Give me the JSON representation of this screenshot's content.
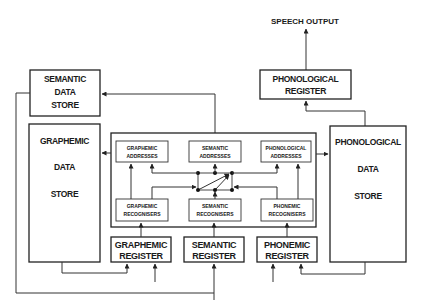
{
  "output_label": "SPEECH OUTPUT",
  "phonological_register": {
    "line1": "PHONOLOGICAL",
    "line2": "REGISTER"
  },
  "semantic_data_store": {
    "line1": "SEMANTIC",
    "line2": "DATA",
    "line3": "STORE"
  },
  "graphemic_data_store": {
    "line1": "GRAPHEMIC",
    "line2": "DATA",
    "line3": "STORE"
  },
  "phonological_data_store": {
    "line1": "PHONOLOGICAL",
    "line2": "DATA",
    "line3": "STORE"
  },
  "addresses": [
    {
      "line1": "GRAPHEMIC",
      "line2": "ADDRESSES"
    },
    {
      "line1": "SEMANTIC",
      "line2": "ADDRESSES"
    },
    {
      "line1": "PHONOLOGICAL",
      "line2": "ADDRESSES"
    }
  ],
  "recognisers": [
    {
      "line1": "GRAPHEMIC",
      "line2": "RECOGNISERS"
    },
    {
      "line1": "SEMANTIC",
      "line2": "RECOGNISERS"
    },
    {
      "line1": "PHONEMIC",
      "line2": "RECOGNISERS"
    }
  ],
  "registers": [
    {
      "line1": "GRAPHEMIC",
      "line2": "REGISTER"
    },
    {
      "line1": "SEMANTIC",
      "line2": "REGISTER"
    },
    {
      "line1": "PHONEMIC",
      "line2": "REGISTER"
    }
  ],
  "colors": {
    "ink": "#222222",
    "background": "#ffffff"
  }
}
